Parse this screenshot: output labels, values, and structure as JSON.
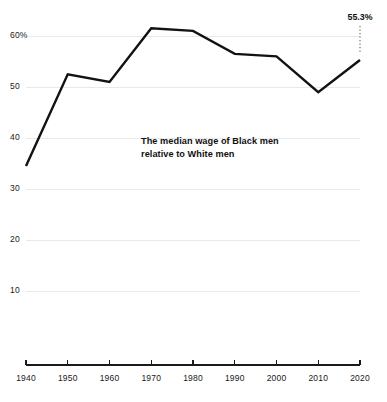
{
  "chart_data": {
    "type": "line",
    "title": "",
    "subtitle": "",
    "xlabel": "",
    "ylabel": "",
    "annotation": {
      "line1": "The median wage of Black men",
      "line2": "relative to White men"
    },
    "end_point_label": "55.3%",
    "x": [
      1940,
      1950,
      1960,
      1970,
      1980,
      1990,
      2000,
      2010,
      2020
    ],
    "categories": [
      "1940",
      "1950",
      "1960",
      "1970",
      "1980",
      "1990",
      "2000",
      "2010",
      "2020"
    ],
    "values": [
      34.5,
      52.5,
      51.0,
      61.5,
      61.0,
      56.5,
      56.0,
      49.0,
      55.3
    ],
    "series": [
      {
        "name": "Median wage of Black men relative to White men",
        "values": [
          34.5,
          52.5,
          51.0,
          61.5,
          61.0,
          56.5,
          56.0,
          49.0,
          55.3
        ],
        "color": "#121212"
      }
    ],
    "ylim": [
      5,
      64
    ],
    "xlim": [
      1940,
      2020
    ],
    "yticks": [
      10,
      20,
      30,
      40,
      50,
      60
    ],
    "ytick_labels": [
      "10",
      "20",
      "30",
      "40",
      "50",
      "60%"
    ],
    "xtick_labels": [
      "1940",
      "1950",
      "1960",
      "1970",
      "1980",
      "1990",
      "2000",
      "2010",
      "2020"
    ],
    "grid": true,
    "grid_axis": "y",
    "legend": false,
    "legend_position": "none",
    "units": "percent",
    "colors": {
      "line": "#121212",
      "gridline": "#e9e9e9",
      "axis": "#1a1a1a",
      "text": "#111111",
      "background": "#ffffff",
      "leader": "#555555"
    }
  }
}
